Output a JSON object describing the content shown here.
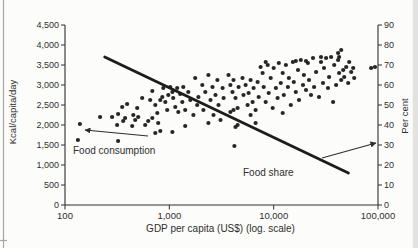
{
  "figure": {
    "kind": "scanned scatter chart, food consumption and food share vs GDP per capita"
  },
  "colors": {
    "ink": "#2e2e2e",
    "point": "#262626",
    "trend_line": "#1c1c1c",
    "paper": "#fcfcfa",
    "page_edge": "#aba7a0",
    "page_edge_band": "#e4e2de"
  },
  "chart_data": {
    "type": "scatter",
    "title": "",
    "xlabel": "GDP per capita (US$) (log. scale)",
    "ylabel_left": "Kcal/capita/day",
    "ylabel_right": "Per cent",
    "x_scale": "log",
    "x_range": [
      100,
      100000
    ],
    "y_left_range": [
      0,
      4500
    ],
    "y_right_range": [
      0,
      90
    ],
    "grid": false,
    "x_ticks": [
      {
        "v": 100,
        "label": "100"
      },
      {
        "v": 1000,
        "label": "1,000"
      },
      {
        "v": 10000,
        "label": "10,000"
      },
      {
        "v": 100000,
        "label": "100,000"
      }
    ],
    "y_left_ticks": [
      {
        "v": 0,
        "label": "0"
      },
      {
        "v": 500,
        "label": "500"
      },
      {
        "v": 1000,
        "label": "1,000"
      },
      {
        "v": 1500,
        "label": "1,500"
      },
      {
        "v": 2000,
        "label": "2,000"
      },
      {
        "v": 2500,
        "label": "2,500"
      },
      {
        "v": 3000,
        "label": "3,000"
      },
      {
        "v": 3500,
        "label": "3,500"
      },
      {
        "v": 4000,
        "label": "4,000"
      },
      {
        "v": 4500,
        "label": "4,500"
      }
    ],
    "y_right_ticks": [
      {
        "v": 0,
        "label": "0"
      },
      {
        "v": 10,
        "label": "10"
      },
      {
        "v": 20,
        "label": "20"
      },
      {
        "v": 30,
        "label": "30"
      },
      {
        "v": 40,
        "label": "40"
      },
      {
        "v": 50,
        "label": "50"
      },
      {
        "v": 60,
        "label": "60"
      },
      {
        "v": 70,
        "label": "70"
      },
      {
        "v": 80,
        "label": "80"
      },
      {
        "v": 90,
        "label": "90"
      }
    ],
    "series": [
      {
        "name": "Food consumption",
        "type": "scatter",
        "axis": "left",
        "units": "kcal/capita/day vs US$",
        "points": [
          [
            133,
            1625
          ],
          [
            139,
            2025
          ],
          [
            217,
            2200
          ],
          [
            283,
            2200
          ],
          [
            316,
            2000
          ],
          [
            323,
            2275
          ],
          [
            323,
            1600
          ],
          [
            353,
            2450
          ],
          [
            361,
            2100
          ],
          [
            377,
            2175
          ],
          [
            394,
            2525
          ],
          [
            441,
            1975
          ],
          [
            451,
            2250
          ],
          [
            471,
            2125
          ],
          [
            492,
            2425
          ],
          [
            503,
            2200
          ],
          [
            549,
            2675
          ],
          [
            587,
            2000
          ],
          [
            627,
            2100
          ],
          [
            656,
            2625
          ],
          [
            687,
            2850
          ],
          [
            687,
            2175
          ],
          [
            733,
            2500
          ],
          [
            733,
            1800
          ],
          [
            766,
            2300
          ],
          [
            783,
            2050
          ],
          [
            819,
            2625
          ],
          [
            819,
            1850
          ],
          [
            856,
            2700
          ],
          [
            875,
            2925
          ],
          [
            914,
            2575
          ],
          [
            955,
            2375
          ],
          [
            977,
            2750
          ],
          [
            1020,
            2950
          ],
          [
            1070,
            2825
          ],
          [
            1070,
            1825
          ],
          [
            1090,
            2675
          ],
          [
            1140,
            2450
          ],
          [
            1190,
            2925
          ],
          [
            1220,
            2325
          ],
          [
            1270,
            2775
          ],
          [
            1330,
            2575
          ],
          [
            1360,
            2950
          ],
          [
            1420,
            2375
          ],
          [
            1420,
            1975
          ],
          [
            1520,
            2825
          ],
          [
            1590,
            2625
          ],
          [
            1700,
            2250
          ],
          [
            1770,
            3175
          ],
          [
            1850,
            2500
          ],
          [
            1900,
            2700
          ],
          [
            2070,
            3000
          ],
          [
            2120,
            2375
          ],
          [
            2210,
            2825
          ],
          [
            2370,
            3250
          ],
          [
            2370,
            2050
          ],
          [
            2480,
            2625
          ],
          [
            2590,
            2950
          ],
          [
            2650,
            2250
          ],
          [
            2770,
            2750
          ],
          [
            2890,
            3125
          ],
          [
            2960,
            2500
          ],
          [
            3090,
            2125
          ],
          [
            3240,
            2925
          ],
          [
            3310,
            2675
          ],
          [
            3690,
            3250
          ],
          [
            3850,
            3000
          ],
          [
            3850,
            2325
          ],
          [
            4030,
            2825
          ],
          [
            4120,
            2375
          ],
          [
            4120,
            3125
          ],
          [
            4200,
            1475
          ],
          [
            4310,
            2675
          ],
          [
            4310,
            1950
          ],
          [
            4510,
            2425
          ],
          [
            4510,
            2000
          ],
          [
            4610,
            2950
          ],
          [
            5030,
            3175
          ],
          [
            5140,
            2750
          ],
          [
            5380,
            3000
          ],
          [
            5620,
            2500
          ],
          [
            5750,
            2800
          ],
          [
            6010,
            3125
          ],
          [
            6010,
            2250
          ],
          [
            6280,
            2575
          ],
          [
            6420,
            2925
          ],
          [
            6710,
            2375
          ],
          [
            6710,
            2050
          ],
          [
            7020,
            3075
          ],
          [
            7180,
            2700
          ],
          [
            7500,
            3450
          ],
          [
            7840,
            3300
          ],
          [
            8020,
            2950
          ],
          [
            8380,
            2575
          ],
          [
            8380,
            3575
          ],
          [
            8760,
            3500
          ],
          [
            8960,
            2800
          ],
          [
            9370,
            3175
          ],
          [
            9790,
            2425
          ],
          [
            10000,
            3425
          ],
          [
            10500,
            2925
          ],
          [
            10900,
            2675
          ],
          [
            11200,
            3550
          ],
          [
            11700,
            3050
          ],
          [
            12200,
            3300
          ],
          [
            12200,
            2300
          ],
          [
            12500,
            2750
          ],
          [
            13100,
            3500
          ],
          [
            13700,
            2950
          ],
          [
            14000,
            3175
          ],
          [
            14600,
            2500
          ],
          [
            15300,
            3575
          ],
          [
            15600,
            3075
          ],
          [
            16300,
            2825
          ],
          [
            16300,
            3600
          ],
          [
            17100,
            3375
          ],
          [
            17500,
            2625
          ],
          [
            18200,
            3625
          ],
          [
            19100,
            3000
          ],
          [
            19500,
            3250
          ],
          [
            20400,
            2875
          ],
          [
            20400,
            3600
          ],
          [
            21300,
            3550
          ],
          [
            21800,
            3125
          ],
          [
            22800,
            2750
          ],
          [
            23800,
            3675
          ],
          [
            24400,
            2950
          ],
          [
            25500,
            3325
          ],
          [
            27200,
            2700
          ],
          [
            28400,
            3575
          ],
          [
            28400,
            3700
          ],
          [
            29700,
            3050
          ],
          [
            30400,
            3425
          ],
          [
            31800,
            3675
          ],
          [
            33200,
            2925
          ],
          [
            34000,
            3200
          ],
          [
            35500,
            3700
          ],
          [
            37100,
            2575
          ],
          [
            38000,
            3500
          ],
          [
            39700,
            3000
          ],
          [
            41500,
            3625
          ],
          [
            41500,
            3800
          ],
          [
            42400,
            3700
          ],
          [
            42400,
            3300
          ],
          [
            44400,
            3875
          ],
          [
            44400,
            3125
          ],
          [
            46400,
            3375
          ],
          [
            47400,
            3200
          ],
          [
            49600,
            3450
          ],
          [
            51800,
            3050
          ],
          [
            53000,
            3575
          ],
          [
            55400,
            3325
          ],
          [
            57900,
            3425
          ],
          [
            59200,
            3175
          ],
          [
            85800,
            3425
          ],
          [
            93500,
            3450
          ]
        ]
      },
      {
        "name": "Food share",
        "type": "line",
        "axis": "right",
        "units": "per cent vs US$",
        "points": [
          [
            240,
            74
          ],
          [
            52000,
            16
          ]
        ]
      }
    ],
    "annotations": [
      {
        "id": "food-consumption-label",
        "text": "Food consumption",
        "x": 73,
        "y": 154,
        "arrow": {
          "x1": 148,
          "y1": 136,
          "x2": 85,
          "y2": 130
        }
      },
      {
        "id": "food-share-label",
        "text": "Food share",
        "x": 243,
        "y": 176,
        "arrow": {
          "x1": 322,
          "y1": 158,
          "x2": 376,
          "y2": 143
        }
      }
    ],
    "legend": "annotated arrows instead of legend box"
  }
}
